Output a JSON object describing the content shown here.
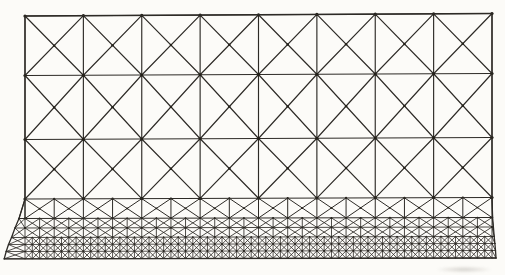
{
  "figure": {
    "caption": ""
  },
  "colors": {
    "background": "#fcfbf8",
    "line": "#2d2a26",
    "node_dot": "#232019"
  },
  "mesh": {
    "x_left": 25,
    "x_right": 492,
    "columns": 8,
    "large_rows": 3,
    "large_levels": [
      [
        16,
        13.5
      ],
      [
        75.5,
        73.5
      ],
      [
        139.5,
        137.5
      ],
      [
        199,
        197.5
      ]
    ],
    "large_stroke_width": 1.15,
    "large_corner_dot_radius": 1.6,
    "large_center_dot_radius": 1.2,
    "band_levels": [
      [
        199,
        197.5
      ],
      [
        218.5,
        217.5
      ],
      [
        228,
        227
      ],
      [
        237.5,
        236.5
      ],
      [
        244.5,
        243.5
      ],
      [
        251.5,
        250.5
      ],
      [
        258.8,
        258
      ]
    ],
    "band_cells_per_column": [
      2,
      4,
      4,
      8,
      8,
      8
    ],
    "band_stroke_widths": [
      1.0,
      0.85,
      0.85,
      0.8,
      0.8,
      0.8
    ],
    "band_corner_dot_radii": [
      1.1,
      0.9,
      0.9,
      0.8,
      0.8,
      0.8
    ],
    "band_center_dot_radii": [
      0.9,
      0,
      0,
      0,
      0,
      0
    ],
    "left_flare_x": [
      25,
      19,
      15,
      11.5,
      8.5,
      6.2,
      4.2
    ],
    "right_flare_x": [
      492,
      492.6,
      493.4,
      494.2,
      494.9,
      495.5,
      496
    ],
    "boundary_stroke_width": 1.3
  }
}
